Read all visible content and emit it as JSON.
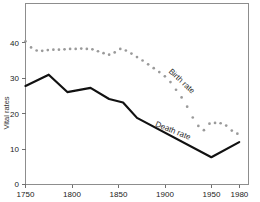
{
  "chart_data": {
    "type": "line",
    "title": "",
    "xlabel": "",
    "ylabel": "Vital rates",
    "xlim": [
      1750,
      1990
    ],
    "ylim": [
      0,
      47
    ],
    "grid": false,
    "legend": "inline-annotations",
    "xticks": [
      1750,
      1800,
      1850,
      1900,
      1950,
      1980
    ],
    "xtick_labels": [
      "1750",
      "1800",
      "1850",
      "1900",
      "1950",
      "1980"
    ],
    "yticks": [
      0,
      10,
      20,
      30,
      40
    ],
    "ytick_labels": [
      "0",
      "10",
      "20",
      "30",
      "40"
    ],
    "series": [
      {
        "name": "Birth rate",
        "style": "dotted",
        "color": "#9a9a9a",
        "annotation": "Birth rate",
        "x": [
          1750,
          1756,
          1762,
          1768,
          1774,
          1780,
          1786,
          1792,
          1798,
          1804,
          1810,
          1816,
          1822,
          1828,
          1834,
          1840,
          1846,
          1852,
          1858,
          1864,
          1870,
          1876,
          1882,
          1888,
          1894,
          1900,
          1906,
          1912,
          1918,
          1924,
          1930,
          1936,
          1942,
          1948,
          1954,
          1960,
          1966,
          1972,
          1978
        ],
        "values": [
          37.2,
          35.6,
          34.8,
          34.7,
          34.9,
          35.0,
          35.0,
          35.1,
          35.2,
          35.2,
          35.3,
          35.2,
          35.1,
          34.6,
          34.1,
          33.7,
          34.3,
          35.2,
          34.8,
          34.0,
          33.1,
          32.2,
          31.2,
          30.2,
          29.2,
          28.1,
          26.6,
          24.6,
          22.6,
          20.2,
          17.4,
          15.2,
          14.1,
          15.8,
          16.0,
          15.9,
          15.3,
          14.0,
          13.2
        ]
      },
      {
        "name": "Death rate",
        "style": "solid",
        "color": "#111111",
        "annotation": "Death rate",
        "x": [
          1750,
          1775,
          1795,
          1820,
          1840,
          1855,
          1870,
          1950,
          1980
        ],
        "values": [
          25.6,
          28.5,
          24.0,
          25.1,
          22.2,
          21.3,
          17.3,
          7.1,
          11.0
        ]
      }
    ]
  }
}
